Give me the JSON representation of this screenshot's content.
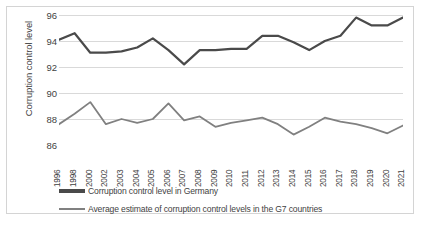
{
  "chart_data": {
    "type": "line",
    "title": "",
    "xlabel": "",
    "ylabel": "Corruption control level",
    "ylim": [
      86,
      96
    ],
    "yticks": [
      86,
      88,
      90,
      92,
      94,
      96
    ],
    "grid": true,
    "legend_position": "bottom",
    "categories": [
      "1996",
      "1998",
      "2000",
      "2002",
      "2003",
      "2004",
      "2005",
      "2006",
      "2007",
      "2008",
      "2009",
      "2010",
      "2011",
      "2012",
      "2013",
      "2014",
      "2015",
      "2016",
      "2017",
      "2018",
      "2019",
      "2020",
      "2021"
    ],
    "series": [
      {
        "name": "Corruption control level in Germany",
        "color": "#4a4a4a",
        "values": [
          94.1,
          94.6,
          93.1,
          93.1,
          93.2,
          93.5,
          94.2,
          93.3,
          92.2,
          93.3,
          93.3,
          93.4,
          93.4,
          94.4,
          94.4,
          93.9,
          93.3,
          94.0,
          94.4,
          95.8,
          95.2,
          95.2,
          95.8
        ]
      },
      {
        "name": "Average estimate of corruption control levels in the G7 countries",
        "color": "#808080",
        "values": [
          87.6,
          88.4,
          89.3,
          87.6,
          88.0,
          87.7,
          88.0,
          89.2,
          87.9,
          88.2,
          87.4,
          87.7,
          87.9,
          88.1,
          87.6,
          86.8,
          87.4,
          88.1,
          87.8,
          87.6,
          87.3,
          86.9,
          87.5
        ]
      }
    ]
  },
  "axis": {
    "y_title": "Corruption control level",
    "y_ticks": [
      "96",
      "94",
      "92",
      "90",
      "88",
      "86"
    ],
    "x_ticks": [
      "1996",
      "1998",
      "2000",
      "2002",
      "2003",
      "2004",
      "2005",
      "2006",
      "2007",
      "2008",
      "2009",
      "2010",
      "2011",
      "2012",
      "2013",
      "2014",
      "2015",
      "2016",
      "2017",
      "2018",
      "2019",
      "2020",
      "2021"
    ]
  },
  "legend": {
    "items": [
      {
        "label": "Corruption control level in Germany",
        "color": "#4a4a4a"
      },
      {
        "label": "Average estimate of corruption control levels in the G7 countries",
        "color": "#808080"
      }
    ]
  },
  "colors": {
    "germany_line": "#4a4a4a",
    "g7_line": "#808080",
    "gridline": "#d9d9d9",
    "text": "#3f3f3f",
    "frame_border": "#d4d4d4",
    "background": "#ffffff"
  }
}
